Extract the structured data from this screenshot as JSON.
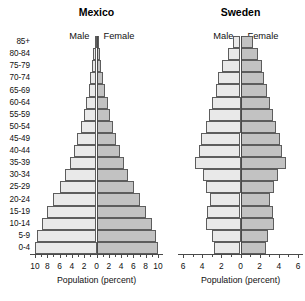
{
  "figure": {
    "age_groups": [
      "85+",
      "80-84",
      "75-79",
      "70-74",
      "65-69",
      "60-64",
      "55-59",
      "50-54",
      "45-49",
      "40-44",
      "35-39",
      "30-34",
      "25-29",
      "20-24",
      "15-19",
      "10-14",
      "5-9",
      "0-4"
    ],
    "male_label": "Male",
    "female_label": "Female",
    "axis_title": "Population (percent)",
    "colors": {
      "male_fill": "#e9e9e9",
      "female_fill": "#c2c2c2",
      "outline": "#5d5d5d",
      "axis": "#4a4a4a",
      "background": "#ffffff"
    }
  },
  "chart_data": [
    {
      "type": "bar",
      "title": "Mexico",
      "subtype": "population-pyramid",
      "xlabel": "Population (percent)",
      "ylabel": "",
      "categories": [
        "85+",
        "80-84",
        "75-79",
        "70-74",
        "65-69",
        "60-64",
        "55-59",
        "50-54",
        "45-49",
        "40-44",
        "35-39",
        "30-34",
        "25-29",
        "20-24",
        "15-19",
        "10-14",
        "5-9",
        "0-4"
      ],
      "xlim": [
        -10,
        10
      ],
      "xticks": [
        10,
        8,
        6,
        4,
        2,
        0,
        2,
        4,
        6,
        8,
        10
      ],
      "grid": false,
      "legend": [
        "Male",
        "Female"
      ],
      "legend_position": "top",
      "series": [
        {
          "name": "Male",
          "side": "left",
          "values": [
            0.3,
            0.5,
            0.7,
            1.0,
            1.3,
            1.7,
            2.1,
            2.6,
            3.1,
            3.7,
            4.3,
            5.1,
            6.0,
            7.0,
            8.0,
            8.9,
            9.6,
            10.0
          ]
        },
        {
          "name": "Female",
          "side": "right",
          "values": [
            0.3,
            0.5,
            0.8,
            1.1,
            1.4,
            1.8,
            2.2,
            2.7,
            3.2,
            3.8,
            4.4,
            5.2,
            6.1,
            7.1,
            8.1,
            9.0,
            9.7,
            10.0
          ]
        }
      ]
    },
    {
      "type": "bar",
      "title": "Sweden",
      "subtype": "population-pyramid",
      "xlabel": "Population (percent)",
      "ylabel": "",
      "categories": [
        "85+",
        "80-84",
        "75-79",
        "70-74",
        "65-69",
        "60-64",
        "55-59",
        "50-54",
        "45-49",
        "40-44",
        "35-39",
        "30-34",
        "25-29",
        "20-24",
        "15-19",
        "10-14",
        "5-9",
        "0-4"
      ],
      "xlim": [
        -6,
        6
      ],
      "xticks": [
        6,
        4,
        2,
        0,
        2,
        4,
        6
      ],
      "grid": false,
      "legend": [
        "Male",
        "Female"
      ],
      "legend_position": "top",
      "series": [
        {
          "name": "Male",
          "side": "left",
          "values": [
            0.8,
            1.3,
            1.9,
            2.3,
            2.6,
            3.0,
            3.3,
            3.6,
            4.1,
            4.3,
            4.8,
            3.9,
            3.6,
            3.2,
            3.5,
            3.6,
            3.0,
            2.8
          ]
        },
        {
          "name": "Female",
          "side": "right",
          "values": [
            1.3,
            1.8,
            2.2,
            2.5,
            2.8,
            3.1,
            3.4,
            3.7,
            4.1,
            4.3,
            4.7,
            3.9,
            3.5,
            3.1,
            3.4,
            3.5,
            2.9,
            2.7
          ]
        }
      ]
    }
  ]
}
